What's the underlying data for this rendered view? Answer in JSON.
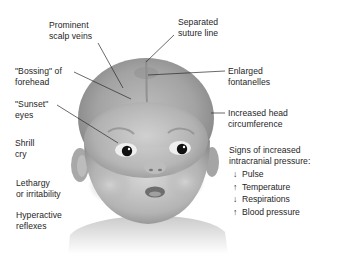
{
  "figure": {
    "labels": {
      "prominent_scalp_veins": [
        "Prominent",
        "scalp veins"
      ],
      "separated_suture_line": [
        "Separated",
        "suture line"
      ],
      "bossing_of_forehead": [
        "\"Bossing\" of",
        "forehead"
      ],
      "enlarged_fontanelles": [
        "Enlarged",
        "fontanelles"
      ],
      "sunset_eyes": [
        "\"Sunset\"",
        "eyes"
      ],
      "increased_head_circumference": [
        "Increased head",
        "circumference"
      ],
      "shrill_cry": [
        "Shrill",
        "cry"
      ],
      "lethargy_or_irritability": [
        "Lethargy",
        "or irritability"
      ],
      "hyperactive_reflexes": [
        "Hyperactive",
        "reflexes"
      ]
    },
    "icp_signs": {
      "heading": [
        "Signs of increased",
        "intracranial pressure:"
      ],
      "items": [
        {
          "arrow": "↓",
          "direction": "decreased",
          "label": "Pulse"
        },
        {
          "arrow": "↑",
          "direction": "increased",
          "label": "Temperature"
        },
        {
          "arrow": "↓",
          "direction": "decreased",
          "label": "Respirations"
        },
        {
          "arrow": "↑",
          "direction": "increased",
          "label": "Blood pressure"
        }
      ]
    },
    "colors": {
      "text": "#1e1e1e",
      "leader_line": "#2a2a2a",
      "skin_mid": "#9a9a9a",
      "skin_light": "#c8c8c8",
      "background": "#ffffff"
    }
  }
}
